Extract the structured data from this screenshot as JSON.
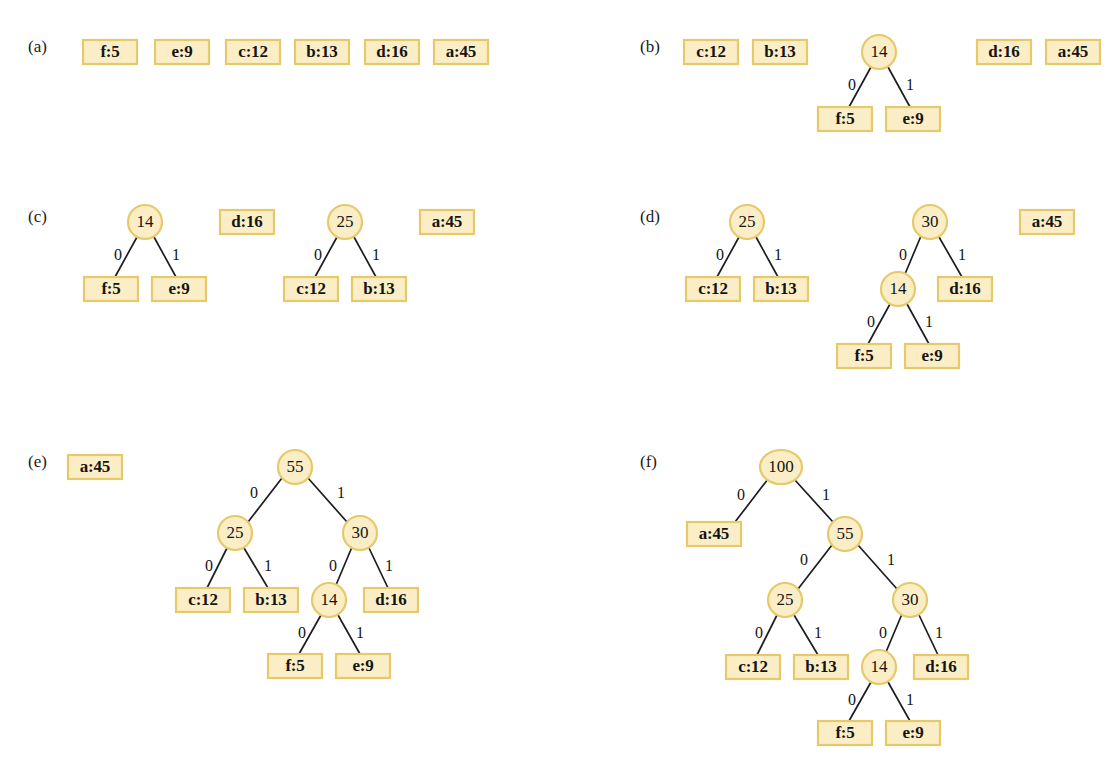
{
  "figure": {
    "colors": {
      "box_fill": "#fbeec6",
      "box_border": "#e6c96a",
      "node_fill": "#fbeec6",
      "node_border": "#e6c96a",
      "edge": "#1d1d22",
      "text": "#141414",
      "background": "#ffffff"
    },
    "edge_labels": {
      "left": "0",
      "right": "1"
    },
    "leaf_size": {
      "w": 54,
      "h": 24
    },
    "node_radius": 17
  },
  "panels": [
    {
      "id": "a",
      "label": "(a)",
      "label_x": 28,
      "label_y": 52,
      "leaves": [
        {
          "name": "leaf-f5",
          "text": "f:5",
          "x": 110,
          "y": 52
        },
        {
          "name": "leaf-e9",
          "text": "e:9",
          "x": 182,
          "y": 52
        },
        {
          "name": "leaf-c12",
          "text": "c:12",
          "x": 253,
          "y": 52
        },
        {
          "name": "leaf-b13",
          "text": "b:13",
          "x": 322,
          "y": 52
        },
        {
          "name": "leaf-d16",
          "text": "d:16",
          "x": 392,
          "y": 52
        },
        {
          "name": "leaf-a45",
          "text": "a:45",
          "x": 461,
          "y": 52
        }
      ],
      "nodes": [],
      "edges": []
    },
    {
      "id": "b",
      "label": "(b)",
      "label_x": 640,
      "label_y": 52,
      "leaves": [
        {
          "name": "leaf-c12",
          "text": "c:12",
          "x": 711,
          "y": 52
        },
        {
          "name": "leaf-b13",
          "text": "b:13",
          "x": 780,
          "y": 52
        },
        {
          "name": "leaf-d16",
          "text": "d:16",
          "x": 1004,
          "y": 52
        },
        {
          "name": "leaf-a45",
          "text": "a:45",
          "x": 1073,
          "y": 52
        },
        {
          "name": "leaf-f5",
          "text": "f:5",
          "x": 845,
          "y": 119
        },
        {
          "name": "leaf-e9",
          "text": "e:9",
          "x": 913,
          "y": 119
        }
      ],
      "nodes": [
        {
          "name": "node-14",
          "text": "14",
          "x": 879,
          "y": 52
        }
      ],
      "edges": [
        {
          "name": "edge-14-f5",
          "x1": 871,
          "y1": 67,
          "x2": 849,
          "y2": 107,
          "label": "0",
          "lx": 852,
          "ly": 86
        },
        {
          "name": "edge-14-e9",
          "x1": 888,
          "y1": 67,
          "x2": 910,
          "y2": 107,
          "label": "1",
          "lx": 910,
          "ly": 86
        }
      ]
    },
    {
      "id": "c",
      "label": "(c)",
      "label_x": 28,
      "label_y": 222,
      "leaves": [
        {
          "name": "leaf-d16",
          "text": "d:16",
          "x": 247,
          "y": 222
        },
        {
          "name": "leaf-a45",
          "text": "a:45",
          "x": 447,
          "y": 222
        },
        {
          "name": "leaf-f5",
          "text": "f:5",
          "x": 111,
          "y": 289
        },
        {
          "name": "leaf-e9",
          "text": "e:9",
          "x": 179,
          "y": 289
        },
        {
          "name": "leaf-c12",
          "text": "c:12",
          "x": 311,
          "y": 289
        },
        {
          "name": "leaf-b13",
          "text": "b:13",
          "x": 379,
          "y": 289
        }
      ],
      "nodes": [
        {
          "name": "node-14",
          "text": "14",
          "x": 145,
          "y": 222
        },
        {
          "name": "node-25",
          "text": "25",
          "x": 345,
          "y": 222
        }
      ],
      "edges": [
        {
          "name": "edge-14-f5",
          "x1": 137,
          "y1": 237,
          "x2": 115,
          "y2": 277,
          "label": "0",
          "lx": 118,
          "ly": 256
        },
        {
          "name": "edge-14-e9",
          "x1": 154,
          "y1": 237,
          "x2": 176,
          "y2": 277,
          "label": "1",
          "lx": 176,
          "ly": 256
        },
        {
          "name": "edge-25-c12",
          "x1": 337,
          "y1": 237,
          "x2": 315,
          "y2": 277,
          "label": "0",
          "lx": 318,
          "ly": 256
        },
        {
          "name": "edge-25-b13",
          "x1": 354,
          "y1": 237,
          "x2": 376,
          "y2": 277,
          "label": "1",
          "lx": 376,
          "ly": 256
        }
      ]
    },
    {
      "id": "d",
      "label": "(d)",
      "label_x": 640,
      "label_y": 222,
      "leaves": [
        {
          "name": "leaf-a45",
          "text": "a:45",
          "x": 1047,
          "y": 222
        },
        {
          "name": "leaf-c12",
          "text": "c:12",
          "x": 713,
          "y": 289
        },
        {
          "name": "leaf-b13",
          "text": "b:13",
          "x": 781,
          "y": 289
        },
        {
          "name": "leaf-d16",
          "text": "d:16",
          "x": 965,
          "y": 289
        },
        {
          "name": "leaf-f5",
          "text": "f:5",
          "x": 864,
          "y": 356
        },
        {
          "name": "leaf-e9",
          "text": "e:9",
          "x": 932,
          "y": 356
        }
      ],
      "nodes": [
        {
          "name": "node-25",
          "text": "25",
          "x": 747,
          "y": 222
        },
        {
          "name": "node-30",
          "text": "30",
          "x": 930,
          "y": 222
        },
        {
          "name": "node-14",
          "text": "14",
          "x": 898,
          "y": 289
        }
      ],
      "edges": [
        {
          "name": "edge-25-c12",
          "x1": 739,
          "y1": 237,
          "x2": 717,
          "y2": 277,
          "label": "0",
          "lx": 720,
          "ly": 256
        },
        {
          "name": "edge-25-b13",
          "x1": 756,
          "y1": 237,
          "x2": 778,
          "y2": 277,
          "label": "1",
          "lx": 778,
          "ly": 256
        },
        {
          "name": "edge-30-14",
          "x1": 921,
          "y1": 236,
          "x2": 905,
          "y2": 274,
          "label": "0",
          "lx": 903,
          "ly": 256
        },
        {
          "name": "edge-30-d16",
          "x1": 939,
          "y1": 237,
          "x2": 962,
          "y2": 277,
          "label": "1",
          "lx": 962,
          "ly": 256
        },
        {
          "name": "edge-14-f5",
          "x1": 890,
          "y1": 304,
          "x2": 868,
          "y2": 344,
          "label": "0",
          "lx": 871,
          "ly": 323
        },
        {
          "name": "edge-14-e9",
          "x1": 907,
          "y1": 304,
          "x2": 929,
          "y2": 344,
          "label": "1",
          "lx": 929,
          "ly": 323
        }
      ]
    },
    {
      "id": "e",
      "label": "(e)",
      "label_x": 28,
      "label_y": 467,
      "leaves": [
        {
          "name": "leaf-a45",
          "text": "a:45",
          "x": 95,
          "y": 467
        },
        {
          "name": "leaf-c12",
          "text": "c:12",
          "x": 203,
          "y": 600
        },
        {
          "name": "leaf-b13",
          "text": "b:13",
          "x": 271,
          "y": 600
        },
        {
          "name": "leaf-d16",
          "text": "d:16",
          "x": 391,
          "y": 600
        },
        {
          "name": "leaf-f5",
          "text": "f:5",
          "x": 295,
          "y": 666
        },
        {
          "name": "leaf-e9",
          "text": "e:9",
          "x": 363,
          "y": 666
        }
      ],
      "nodes": [
        {
          "name": "node-55",
          "text": "55",
          "x": 295,
          "y": 467
        },
        {
          "name": "node-25",
          "text": "25",
          "x": 235,
          "y": 533
        },
        {
          "name": "node-30",
          "text": "30",
          "x": 360,
          "y": 533
        },
        {
          "name": "node-14",
          "text": "14",
          "x": 329,
          "y": 600
        }
      ],
      "edges": [
        {
          "name": "edge-55-25",
          "x1": 282,
          "y1": 478,
          "x2": 248,
          "y2": 522,
          "label": "0",
          "lx": 254,
          "ly": 494
        },
        {
          "name": "edge-55-30",
          "x1": 308,
          "y1": 478,
          "x2": 347,
          "y2": 522,
          "label": "1",
          "lx": 341,
          "ly": 494
        },
        {
          "name": "edge-25-c12",
          "x1": 227,
          "y1": 548,
          "x2": 207,
          "y2": 588,
          "label": "0",
          "lx": 209,
          "ly": 567
        },
        {
          "name": "edge-25-b13",
          "x1": 244,
          "y1": 548,
          "x2": 268,
          "y2": 588,
          "label": "1",
          "lx": 268,
          "ly": 567
        },
        {
          "name": "edge-30-14",
          "x1": 352,
          "y1": 547,
          "x2": 336,
          "y2": 585,
          "label": "0",
          "lx": 333,
          "ly": 567
        },
        {
          "name": "edge-30-d16",
          "x1": 369,
          "y1": 548,
          "x2": 388,
          "y2": 588,
          "label": "1",
          "lx": 389,
          "ly": 567
        },
        {
          "name": "edge-14-f5",
          "x1": 321,
          "y1": 615,
          "x2": 299,
          "y2": 654,
          "label": "0",
          "lx": 302,
          "ly": 634
        },
        {
          "name": "edge-14-e9",
          "x1": 338,
          "y1": 615,
          "x2": 360,
          "y2": 654,
          "label": "1",
          "lx": 360,
          "ly": 634
        }
      ]
    },
    {
      "id": "f",
      "label": "(f)",
      "label_x": 640,
      "label_y": 467,
      "leaves": [
        {
          "name": "leaf-a45",
          "text": "a:45",
          "x": 714,
          "y": 534
        },
        {
          "name": "leaf-c12",
          "text": "c:12",
          "x": 753,
          "y": 667
        },
        {
          "name": "leaf-b13",
          "text": "b:13",
          "x": 821,
          "y": 667
        },
        {
          "name": "leaf-d16",
          "text": "d:16",
          "x": 941,
          "y": 667
        },
        {
          "name": "leaf-f5",
          "text": "f:5",
          "x": 845,
          "y": 733
        },
        {
          "name": "leaf-e9",
          "text": "e:9",
          "x": 913,
          "y": 733
        }
      ],
      "nodes": [
        {
          "name": "node-100",
          "text": "100",
          "x": 781,
          "y": 467
        },
        {
          "name": "node-55",
          "text": "55",
          "x": 845,
          "y": 534
        },
        {
          "name": "node-25",
          "text": "25",
          "x": 785,
          "y": 600
        },
        {
          "name": "node-30",
          "text": "30",
          "x": 910,
          "y": 600
        },
        {
          "name": "node-14",
          "text": "14",
          "x": 879,
          "y": 667
        }
      ],
      "edges": [
        {
          "name": "edge-100-a45",
          "x1": 768,
          "y1": 479,
          "x2": 735,
          "y2": 522,
          "label": "0",
          "lx": 741,
          "ly": 496
        },
        {
          "name": "edge-100-55",
          "x1": 794,
          "y1": 479,
          "x2": 833,
          "y2": 522,
          "label": "1",
          "lx": 826,
          "ly": 496
        },
        {
          "name": "edge-55-25",
          "x1": 832,
          "y1": 545,
          "x2": 798,
          "y2": 589,
          "label": "0",
          "lx": 804,
          "ly": 561
        },
        {
          "name": "edge-55-30",
          "x1": 858,
          "y1": 545,
          "x2": 897,
          "y2": 589,
          "label": "1",
          "lx": 891,
          "ly": 561
        },
        {
          "name": "edge-25-c12",
          "x1": 777,
          "y1": 615,
          "x2": 757,
          "y2": 655,
          "label": "0",
          "lx": 759,
          "ly": 634
        },
        {
          "name": "edge-25-b13",
          "x1": 794,
          "y1": 615,
          "x2": 818,
          "y2": 655,
          "label": "1",
          "lx": 818,
          "ly": 634
        },
        {
          "name": "edge-30-14",
          "x1": 902,
          "y1": 614,
          "x2": 886,
          "y2": 652,
          "label": "0",
          "lx": 883,
          "ly": 634
        },
        {
          "name": "edge-30-d16",
          "x1": 919,
          "y1": 615,
          "x2": 938,
          "y2": 655,
          "label": "1",
          "lx": 939,
          "ly": 634
        },
        {
          "name": "edge-14-f5",
          "x1": 871,
          "y1": 682,
          "x2": 849,
          "y2": 721,
          "label": "0",
          "lx": 852,
          "ly": 701
        },
        {
          "name": "edge-14-e9",
          "x1": 888,
          "y1": 682,
          "x2": 910,
          "y2": 721,
          "label": "1",
          "lx": 910,
          "ly": 701
        }
      ]
    }
  ]
}
